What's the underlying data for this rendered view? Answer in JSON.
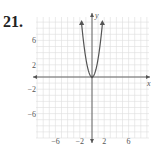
{
  "problem_number": "21.",
  "chart_data": {
    "type": "line",
    "title": "",
    "xlabel": "x",
    "ylabel": "y",
    "xlim": [
      -9,
      9
    ],
    "ylim": [
      -10,
      10
    ],
    "grid": true,
    "x_ticks": [
      -6,
      -2,
      2,
      6
    ],
    "y_ticks": [
      6,
      2,
      -2,
      -6
    ],
    "x_tick_labels": [
      "−6",
      "−2",
      "2",
      "6"
    ],
    "y_tick_labels": [
      "6",
      "2",
      "−2",
      "−6"
    ],
    "series": [
      {
        "name": "parabola",
        "description": "Upward-opening parabola with vertex at origin, arrows at ends",
        "x": [
          -1.75,
          -1.5,
          -1,
          -0.5,
          0,
          0.5,
          1,
          1.5,
          1.75
        ],
        "y": [
          9.2,
          6.75,
          3,
          0.75,
          0,
          0.75,
          3,
          6.75,
          9.2
        ]
      }
    ],
    "colors": {
      "curve": "#555555",
      "axis": "#555555",
      "grid": "#dddddd"
    }
  }
}
